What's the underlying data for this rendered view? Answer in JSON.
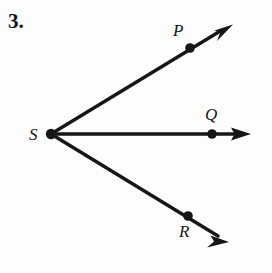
{
  "figure": {
    "problem_number": "3.",
    "background_color": "#fdfdfd",
    "stroke_color": "#161616",
    "vertex": {
      "label": "S",
      "x": 51,
      "y": 134
    },
    "rays": [
      {
        "name": "ray-SP",
        "label": "P",
        "point": {
          "x": 190,
          "y": 48
        },
        "label_pos": {
          "x": 173,
          "y": 22
        },
        "arrow_tip": {
          "x": 233,
          "y": 25
        },
        "direction": "upper-right"
      },
      {
        "name": "ray-SQ",
        "label": "Q",
        "point": {
          "x": 212,
          "y": 134
        },
        "label_pos": {
          "x": 205,
          "y": 106
        },
        "arrow_tip": {
          "x": 251,
          "y": 134
        },
        "direction": "right"
      },
      {
        "name": "ray-SR",
        "label": "R",
        "point": {
          "x": 188,
          "y": 216
        },
        "label_pos": {
          "x": 179,
          "y": 223
        },
        "arrow_tip": {
          "x": 229,
          "y": 241
        },
        "direction": "lower-right"
      }
    ]
  }
}
